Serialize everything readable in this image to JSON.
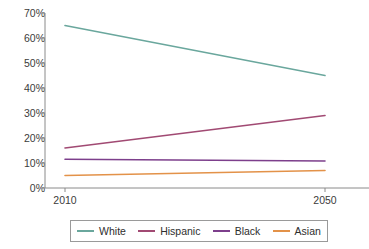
{
  "chart_data": {
    "type": "line",
    "title": "",
    "subtitle": "",
    "xlabel": "",
    "ylabel": "",
    "x": [
      2010,
      2050
    ],
    "categories": [
      "2010",
      "2050"
    ],
    "xtick_labels": [
      "2010",
      "2050"
    ],
    "ytick_labels": [
      "70%",
      "60%",
      "50%",
      "40%",
      "30%",
      "20%",
      "10%",
      "0%"
    ],
    "ytick_values": [
      70,
      60,
      50,
      40,
      30,
      20,
      10,
      0
    ],
    "ylim": [
      0,
      70
    ],
    "xlim": [
      2010,
      2050
    ],
    "grid": false,
    "legend_position": "bottom",
    "value_suffix": "%",
    "series": [
      {
        "name": "White",
        "values": [
          65.0,
          45.0
        ],
        "color": "#6aa79d"
      },
      {
        "name": "Hispanic",
        "values": [
          16.0,
          29.0
        ],
        "color": "#a14a73"
      },
      {
        "name": "Black",
        "values": [
          11.5,
          10.8
        ],
        "color": "#7d3f8c"
      },
      {
        "name": "Asian",
        "values": [
          5.0,
          7.0
        ],
        "color": "#e39249"
      }
    ],
    "axis_color": "#8a8a8a"
  },
  "legend": {
    "items": [
      {
        "label": "White",
        "color": "#6aa79d"
      },
      {
        "label": "Hispanic",
        "color": "#a14a73"
      },
      {
        "label": "Black",
        "color": "#7d3f8c"
      },
      {
        "label": "Asian",
        "color": "#e39249"
      }
    ]
  }
}
